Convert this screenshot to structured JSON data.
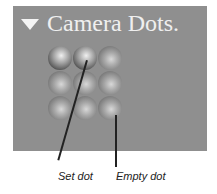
{
  "panel": {
    "title": "Camera Dots.",
    "expand_icon": "triangle-down-icon",
    "background": "#8f8f8f"
  },
  "dots": [
    {
      "row": 0,
      "col": 0,
      "state": "set"
    },
    {
      "row": 0,
      "col": 1,
      "state": "set"
    },
    {
      "row": 0,
      "col": 2,
      "state": "empty"
    },
    {
      "row": 1,
      "col": 0,
      "state": "empty"
    },
    {
      "row": 1,
      "col": 1,
      "state": "empty"
    },
    {
      "row": 1,
      "col": 2,
      "state": "empty"
    },
    {
      "row": 2,
      "col": 0,
      "state": "empty"
    },
    {
      "row": 2,
      "col": 1,
      "state": "empty"
    },
    {
      "row": 2,
      "col": 2,
      "state": "empty"
    }
  ],
  "callouts": {
    "set_dot": "Set dot",
    "empty_dot": "Empty dot"
  }
}
